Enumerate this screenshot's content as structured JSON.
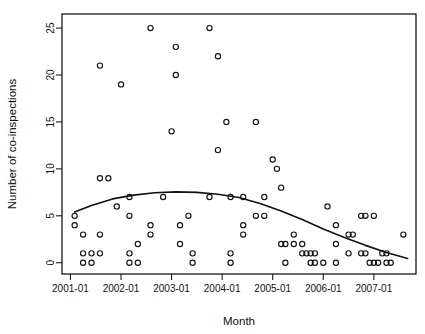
{
  "chart_data": {
    "type": "scatter",
    "title": "",
    "xlabel": "Month",
    "ylabel": "Number of co-inspections",
    "grid": false,
    "legend": false,
    "legend_position": "none",
    "x_tick_labels": [
      "2001-01",
      "2002-01",
      "2003-01",
      "2004-01",
      "2005-01",
      "2006-01",
      "2007-01"
    ],
    "x_tick_values": [
      0,
      12,
      24,
      36,
      48,
      60,
      72
    ],
    "y_tick_labels": [
      "0",
      "5",
      "10",
      "15",
      "20",
      "25"
    ],
    "y_tick_values": [
      0,
      5,
      10,
      15,
      20,
      25
    ],
    "xlim": [
      -2,
      82
    ],
    "ylim": [
      -1.2,
      26.5
    ],
    "x_unit": "months since 2001-01",
    "point_marker": "open-circle",
    "points": [
      {
        "x": 1,
        "y": 5
      },
      {
        "x": 1,
        "y": 4
      },
      {
        "x": 3,
        "y": 3
      },
      {
        "x": 3,
        "y": 1
      },
      {
        "x": 3,
        "y": 0
      },
      {
        "x": 5,
        "y": 1
      },
      {
        "x": 5,
        "y": 0
      },
      {
        "x": 7,
        "y": 21
      },
      {
        "x": 7,
        "y": 9
      },
      {
        "x": 7,
        "y": 3
      },
      {
        "x": 7,
        "y": 1
      },
      {
        "x": 9,
        "y": 9
      },
      {
        "x": 11,
        "y": 6
      },
      {
        "x": 12,
        "y": 19
      },
      {
        "x": 14,
        "y": 7
      },
      {
        "x": 14,
        "y": 5
      },
      {
        "x": 14,
        "y": 1
      },
      {
        "x": 14,
        "y": 0
      },
      {
        "x": 16,
        "y": 2
      },
      {
        "x": 16,
        "y": 0
      },
      {
        "x": 19,
        "y": 25
      },
      {
        "x": 19,
        "y": 4
      },
      {
        "x": 19,
        "y": 3
      },
      {
        "x": 22,
        "y": 7
      },
      {
        "x": 24,
        "y": 14
      },
      {
        "x": 25,
        "y": 20
      },
      {
        "x": 25,
        "y": 23
      },
      {
        "x": 26,
        "y": 4
      },
      {
        "x": 26,
        "y": 2
      },
      {
        "x": 28,
        "y": 5
      },
      {
        "x": 29,
        "y": 1
      },
      {
        "x": 29,
        "y": 0
      },
      {
        "x": 33,
        "y": 25
      },
      {
        "x": 33,
        "y": 7
      },
      {
        "x": 35,
        "y": 12
      },
      {
        "x": 35,
        "y": 22
      },
      {
        "x": 37,
        "y": 15
      },
      {
        "x": 38,
        "y": 7
      },
      {
        "x": 38,
        "y": 1
      },
      {
        "x": 38,
        "y": 0
      },
      {
        "x": 41,
        "y": 7
      },
      {
        "x": 41,
        "y": 4
      },
      {
        "x": 41,
        "y": 3
      },
      {
        "x": 44,
        "y": 15
      },
      {
        "x": 44,
        "y": 5
      },
      {
        "x": 46,
        "y": 7
      },
      {
        "x": 46,
        "y": 5
      },
      {
        "x": 48,
        "y": 11
      },
      {
        "x": 49,
        "y": 10
      },
      {
        "x": 50,
        "y": 8
      },
      {
        "x": 50,
        "y": 2
      },
      {
        "x": 51,
        "y": 2
      },
      {
        "x": 51,
        "y": 0
      },
      {
        "x": 53,
        "y": 3
      },
      {
        "x": 53,
        "y": 2
      },
      {
        "x": 55,
        "y": 2
      },
      {
        "x": 55,
        "y": 1
      },
      {
        "x": 56,
        "y": 1
      },
      {
        "x": 57,
        "y": 1
      },
      {
        "x": 58,
        "y": 1
      },
      {
        "x": 57,
        "y": 0
      },
      {
        "x": 58,
        "y": 0
      },
      {
        "x": 60,
        "y": 0
      },
      {
        "x": 61,
        "y": 6
      },
      {
        "x": 63,
        "y": 4
      },
      {
        "x": 63,
        "y": 2
      },
      {
        "x": 63,
        "y": 0
      },
      {
        "x": 66,
        "y": 3
      },
      {
        "x": 67,
        "y": 3
      },
      {
        "x": 66,
        "y": 1
      },
      {
        "x": 69,
        "y": 5
      },
      {
        "x": 70,
        "y": 5
      },
      {
        "x": 69,
        "y": 1
      },
      {
        "x": 70,
        "y": 1
      },
      {
        "x": 72,
        "y": 5
      },
      {
        "x": 71,
        "y": 0
      },
      {
        "x": 72,
        "y": 0
      },
      {
        "x": 73,
        "y": 0
      },
      {
        "x": 74,
        "y": 1
      },
      {
        "x": 75,
        "y": 1
      },
      {
        "x": 75,
        "y": 0
      },
      {
        "x": 76,
        "y": 0
      },
      {
        "x": 79,
        "y": 3
      }
    ],
    "fit_curve": {
      "label": "smoothed trend",
      "x": [
        1,
        5,
        10,
        15,
        20,
        25,
        30,
        35,
        40,
        45,
        50,
        55,
        60,
        65,
        70,
        75,
        80
      ],
      "y": [
        5.4,
        6.1,
        6.8,
        7.2,
        7.45,
        7.55,
        7.5,
        7.3,
        6.95,
        6.3,
        5.5,
        4.6,
        3.6,
        2.7,
        1.85,
        1.1,
        0.45
      ]
    }
  }
}
